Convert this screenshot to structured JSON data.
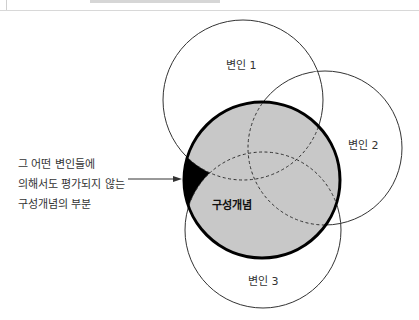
{
  "diagram": {
    "type": "venn",
    "construct": {
      "label": "구성개념",
      "fill": "#c8c8c8",
      "stroke": "#000000",
      "cx": 262,
      "cy": 180,
      "r": 78
    },
    "variables": [
      {
        "label": "변인 1",
        "cx": 243,
        "cy": 100,
        "r": 80
      },
      {
        "label": "변인 2",
        "cx": 325,
        "cy": 148,
        "r": 77
      },
      {
        "label": "변인 3",
        "cx": 263,
        "cy": 230,
        "r": 78
      }
    ],
    "annotation": {
      "lines": [
        "그 어떤 변인들에",
        "의해서도 평가되지 않는",
        "구성개념의 부분"
      ]
    },
    "unmeasured_region_color": "#000000"
  }
}
